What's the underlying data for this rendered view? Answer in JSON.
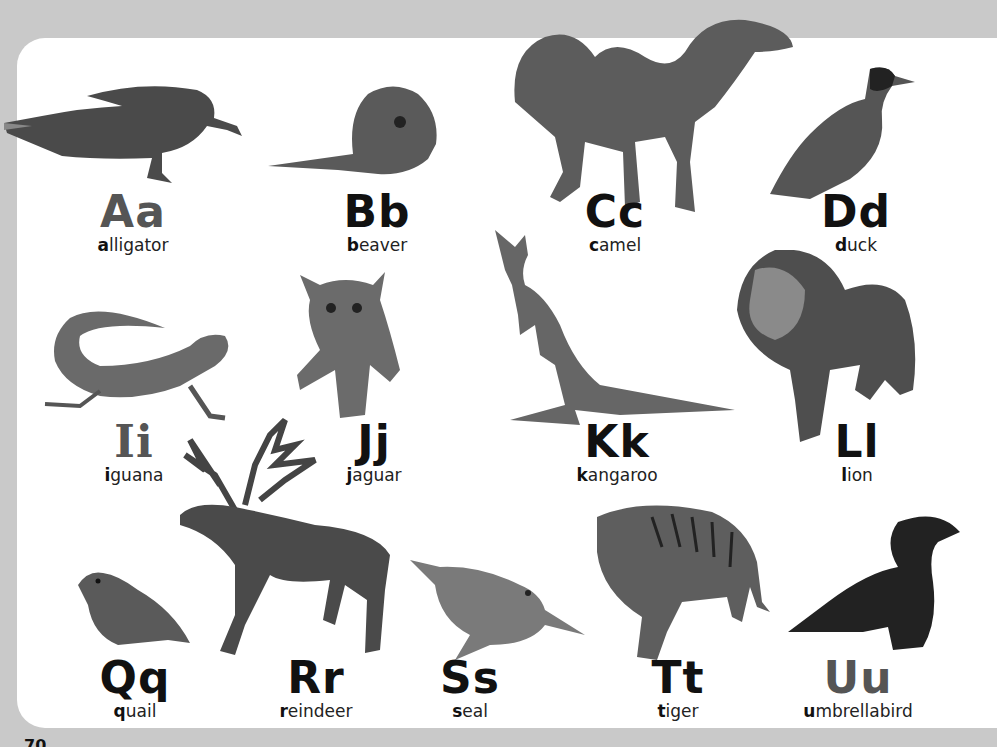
{
  "page": {
    "page_number": "70",
    "background_color": "#c9c9c9",
    "card_color": "#ffffff"
  },
  "entries": [
    {
      "letters": "Aa",
      "initial": "a",
      "rest": "lligator",
      "word": "alligator",
      "color": "#555555",
      "animal_icon": "alligator-icon"
    },
    {
      "letters": "Bb",
      "initial": "b",
      "rest": "eaver",
      "word": "beaver",
      "color": "#111111",
      "animal_icon": "beaver-icon"
    },
    {
      "letters": "Cc",
      "initial": "c",
      "rest": "amel",
      "word": "camel",
      "color": "#111111",
      "animal_icon": "camel-icon"
    },
    {
      "letters": "Dd",
      "initial": "d",
      "rest": "uck",
      "word": "duck",
      "color": "#111111",
      "animal_icon": "duck-icon"
    },
    {
      "letters": "Ii",
      "initial": "i",
      "rest": "guana",
      "word": "iguana",
      "color": "#555555",
      "animal_icon": "iguana-icon"
    },
    {
      "letters": "Jj",
      "initial": "j",
      "rest": "aguar",
      "word": "jaguar",
      "color": "#111111",
      "animal_icon": "jaguar-icon"
    },
    {
      "letters": "Kk",
      "initial": "k",
      "rest": "angaroo",
      "word": "kangaroo",
      "color": "#111111",
      "animal_icon": "kangaroo-icon"
    },
    {
      "letters": "Ll",
      "initial": "l",
      "rest": "ion",
      "word": "lion",
      "color": "#111111",
      "animal_icon": "lion-icon"
    },
    {
      "letters": "Qq",
      "initial": "q",
      "rest": "uail",
      "word": "quail",
      "color": "#111111",
      "animal_icon": "quail-icon"
    },
    {
      "letters": "Rr",
      "initial": "r",
      "rest": "eindeer",
      "word": "reindeer",
      "color": "#111111",
      "animal_icon": "reindeer-icon"
    },
    {
      "letters": "Ss",
      "initial": "s",
      "rest": "eal",
      "word": "seal",
      "color": "#111111",
      "animal_icon": "seal-icon"
    },
    {
      "letters": "Tt",
      "initial": "t",
      "rest": "iger",
      "word": "tiger",
      "color": "#111111",
      "animal_icon": "tiger-icon"
    },
    {
      "letters": "Uu",
      "initial": "u",
      "rest": "mbrellabird",
      "word": "umbrellabird",
      "color": "#555555",
      "animal_icon": "umbrellabird-icon"
    }
  ]
}
